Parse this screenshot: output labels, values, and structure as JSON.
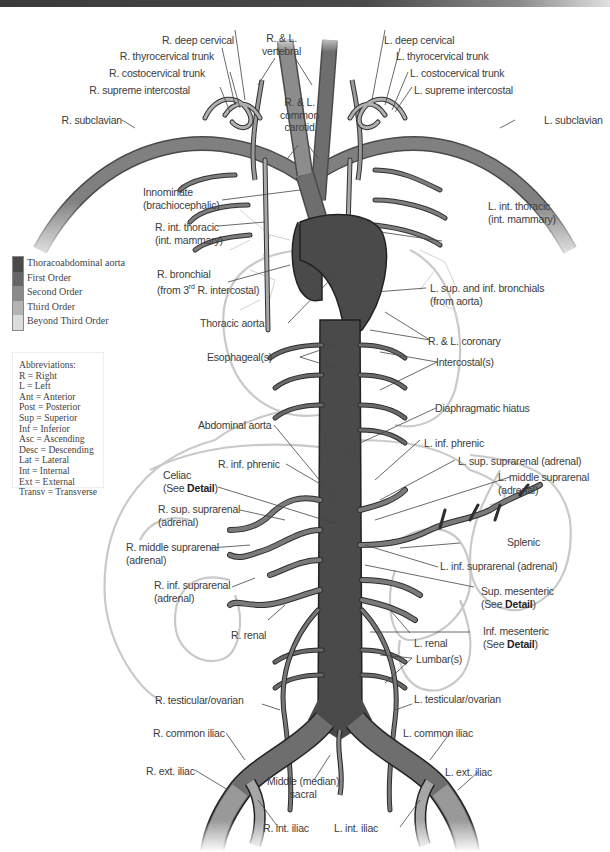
{
  "header": {
    "bar_colors": [
      "#3a3a3a",
      "#8a8a8a",
      "#e0e0e0"
    ]
  },
  "colors": {
    "thoracoabdominal_aorta": "#4a4a4a",
    "first_order": "#666666",
    "second_order": "#8a8a8a",
    "third_order": "#b3b3b3",
    "beyond_third_order": "#dcdcdc",
    "organ_outline": "#c8c8c8",
    "leader_line": "#444444"
  },
  "legend": {
    "items": [
      {
        "label": "Thoracoabdominal aorta",
        "color": "#4a4a4a"
      },
      {
        "label": "First Order",
        "color": "#666666"
      },
      {
        "label": "Second Order",
        "color": "#8a8a8a"
      },
      {
        "label": "Third Order",
        "color": "#b3b3b3"
      },
      {
        "label": "Beyond Third Order",
        "color": "#dcdcdc"
      }
    ]
  },
  "abbreviations": {
    "title": "Abbreviations:",
    "items": [
      "R = Right",
      "L = Left",
      "Ant = Anterior",
      "Post = Posterior",
      "Sup = Superior",
      "Inf = Inferior",
      "Asc = Ascending",
      "Desc = Descending",
      "Lat = Lateral",
      "Int = Internal",
      "Ext = External",
      "Transv = Transverse"
    ]
  },
  "labels": {
    "rl_vertebral": [
      "R. & L.",
      "vertebral"
    ],
    "rl_common_carotid": [
      "R. & L.",
      "common",
      "carotid"
    ],
    "r_deep_cervical": "R. deep cervical",
    "r_thyrocervical_trunk": "R. thyrocervical trunk",
    "r_costocervical_trunk": "R. costocervical trunk",
    "r_supreme_intercostal": "R. supreme intercostal",
    "r_subclavian": "R. subclavian",
    "l_deep_cervical": "L. deep cervical",
    "l_thyrocervical_trunk": "L. thyrocervical trunk",
    "l_costocervical_trunk": "L. costocervical trunk",
    "l_supreme_intercostal": "L. supreme intercostal",
    "l_subclavian": "L. subclavian",
    "innominate": [
      "Innominate",
      "(brachiocephalic)"
    ],
    "r_int_thoracic": [
      "R. int. thoracic",
      "(int. mammary)"
    ],
    "l_int_thoracic": [
      "L. int. thoracic",
      "(int. mammary)"
    ],
    "r_bronchial": [
      "R. bronchial",
      "(from 3",
      "rd",
      " R. intercostal)"
    ],
    "l_bronchials": [
      "L. sup. and inf. bronchials",
      "(from aorta)"
    ],
    "thoracic_aorta": "Thoracic aorta",
    "rl_coronary": "R. & L. coronary",
    "esophageal": "Esophageal(s)",
    "intercostal": "Intercostal(s)",
    "diaphragmatic_hiatus": "Diaphragmatic hiatus",
    "abdominal_aorta": "Abdominal aorta",
    "r_inf_phrenic": "R. inf. phrenic",
    "l_inf_phrenic": "L. inf. phrenic",
    "celiac": [
      "Celiac",
      "(See ",
      "Detail",
      ")"
    ],
    "l_sup_suprarenal": "L. sup. suprarenal (adrenal)",
    "l_middle_suprarenal": [
      "L. middle suprarenal",
      "(adrenal)"
    ],
    "r_sup_suprarenal": [
      "R. sup. suprarenal",
      "(adrenal)"
    ],
    "r_middle_suprarenal": [
      "R. middle suprarenal",
      "(adrenal)"
    ],
    "r_inf_suprarenal": [
      "R. inf. suprarenal",
      "(adrenal)"
    ],
    "splenic": "Splenic",
    "l_inf_suprarenal": "L. inf. suprarenal (adrenal)",
    "sup_mesenteric": [
      "Sup. mesenteric",
      "(See ",
      "Detail",
      ")"
    ],
    "l_renal": "L. renal",
    "r_renal": "R. renal",
    "inf_mesenteric": [
      "Inf. mesenteric",
      "(See ",
      "Detail",
      ")"
    ],
    "lumbar": "Lumbar(s)",
    "r_testicular_ovarian": "R. testicular/ovarian",
    "l_testicular_ovarian": "L. testicular/ovarian",
    "r_common_iliac": "R. common iliac",
    "l_common_iliac": "L. common iliac",
    "r_ext_iliac": "R. ext. iliac",
    "l_ext_iliac": "L. ext. iliac",
    "middle_sacral": [
      "Middle (median)",
      "sacral"
    ],
    "r_int_iliac": "R. int. iliac",
    "l_int_iliac": "L. int. iliac"
  }
}
